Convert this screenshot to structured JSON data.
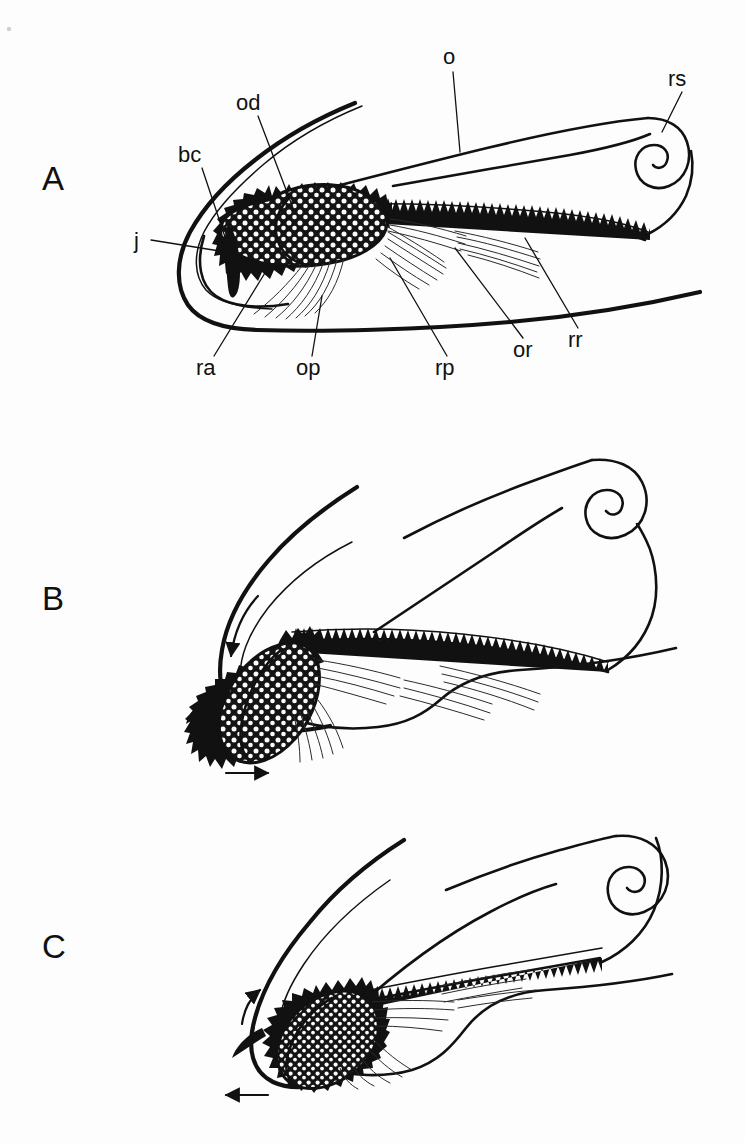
{
  "figure": {
    "background_color": "#fdfdfd",
    "ink_color": "#111111",
    "panel_count": 3
  },
  "panels": [
    {
      "letter": "A",
      "caption": "",
      "labeled": true,
      "labels": [
        {
          "key": "o",
          "text": "o",
          "name": "label-oesophagus",
          "x": 450,
          "y": 62,
          "leader": [
            [
              453,
              72
            ],
            [
              460,
              152
            ]
          ]
        },
        {
          "key": "rs",
          "text": "rs",
          "name": "label-radular-sac",
          "x": 672,
          "y": 83,
          "leader": [
            [
              682,
              92
            ],
            [
              662,
              132
            ]
          ]
        },
        {
          "key": "od",
          "text": "od",
          "name": "label-odontophore",
          "x": 237,
          "y": 107,
          "leader": [
            [
              258,
              116
            ],
            [
              293,
              208
            ]
          ]
        },
        {
          "key": "bc",
          "text": "bc",
          "name": "label-buccal-cavity",
          "x": 180,
          "y": 160,
          "leader": [
            [
              202,
              168
            ],
            [
              228,
              246
            ]
          ]
        },
        {
          "key": "j",
          "text": "j",
          "name": "label-jaw",
          "x": 135,
          "y": 246,
          "leader": [
            [
              148,
              240
            ],
            [
              228,
              252
            ]
          ]
        },
        {
          "key": "ra",
          "text": "ra",
          "name": "label-radula-anterior",
          "x": 197,
          "y": 372,
          "leader": [
            [
              214,
              356
            ],
            [
              268,
              268
            ]
          ]
        },
        {
          "key": "op",
          "text": "op",
          "name": "label-odontophore-protractor",
          "x": 297,
          "y": 372,
          "leader": [
            [
              312,
              356
            ],
            [
              322,
              296
            ]
          ]
        },
        {
          "key": "rp",
          "text": "rp",
          "name": "label-radular-protractor",
          "x": 437,
          "y": 372,
          "leader": [
            [
              447,
              356
            ],
            [
              390,
              258
            ]
          ]
        },
        {
          "key": "or",
          "text": "or",
          "name": "label-odontophore-retractor",
          "x": 515,
          "y": 355,
          "leader": [
            [
              523,
              340
            ],
            [
              455,
              248
            ]
          ]
        },
        {
          "key": "rr",
          "text": "rr",
          "name": "label-radular-retractor",
          "x": 570,
          "y": 345,
          "leader": [
            [
              578,
              330
            ],
            [
              525,
              238
            ]
          ]
        }
      ],
      "arrows": []
    },
    {
      "letter": "B",
      "caption": "",
      "labeled": false,
      "labels": [],
      "arrows": [
        {
          "name": "arrow-odontophore-rotation",
          "direction": "down-curved",
          "style": "curved"
        },
        {
          "name": "arrow-radula-protraction",
          "direction": "right",
          "style": "straight"
        }
      ]
    },
    {
      "letter": "C",
      "caption": "",
      "labeled": false,
      "labels": [],
      "arrows": [
        {
          "name": "arrow-odontophore-rotation",
          "direction": "up-curved",
          "style": "curved"
        },
        {
          "name": "arrow-radula-retraction",
          "direction": "left",
          "style": "straight"
        }
      ]
    }
  ],
  "legend_key": [
    {
      "abbrev": "o",
      "meaning": "oesophagus"
    },
    {
      "abbrev": "rs",
      "meaning": "radular sac"
    },
    {
      "abbrev": "od",
      "meaning": "odontophore"
    },
    {
      "abbrev": "bc",
      "meaning": "buccal cavity"
    },
    {
      "abbrev": "j",
      "meaning": "jaw"
    },
    {
      "abbrev": "ra",
      "meaning": "radula anterior"
    },
    {
      "abbrev": "op",
      "meaning": "odontophore protractor"
    },
    {
      "abbrev": "rp",
      "meaning": "radular protractor"
    },
    {
      "abbrev": "or",
      "meaning": "odontophore retractor"
    },
    {
      "abbrev": "rr",
      "meaning": "radular retractor"
    }
  ]
}
